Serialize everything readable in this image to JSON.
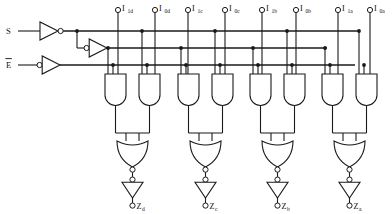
{
  "diagram": {
    "type": "digital-logic-schematic",
    "line_color": "#1a1a1a",
    "background_color": "#ffffff"
  },
  "control_inputs": [
    {
      "id": "select",
      "label": "S",
      "overbar": false,
      "buffer": "non-inverting-buffer",
      "y": 31
    },
    {
      "id": "enable",
      "label": "E",
      "overbar": true,
      "buffer": "inverting-input-buffer",
      "y": 65
    }
  ],
  "internal_nets": [
    {
      "id": "s-true",
      "name": "S buffered",
      "y": 31
    },
    {
      "id": "s-bar",
      "name": "S inverted",
      "y": 48
    },
    {
      "id": "e-net",
      "name": "Enable",
      "y": 65
    }
  ],
  "data_inputs": [
    {
      "id": "i1d",
      "base": "I",
      "sub": "1d",
      "x": 118
    },
    {
      "id": "i0d",
      "base": "I",
      "sub": "0d",
      "x": 155
    },
    {
      "id": "i1c",
      "base": "I",
      "sub": "1c",
      "x": 188
    },
    {
      "id": "i0c",
      "base": "I",
      "sub": "0c",
      "x": 225
    },
    {
      "id": "i1b",
      "base": "I",
      "sub": "1b",
      "x": 262
    },
    {
      "id": "i0b",
      "base": "I",
      "sub": "0b",
      "x": 296
    },
    {
      "id": "i1a",
      "base": "I",
      "sub": "1a",
      "x": 338
    },
    {
      "id": "i0a",
      "base": "I",
      "sub": "0a",
      "x": 370
    }
  ],
  "and_gates": [
    {
      "id": "and-1d",
      "x": 113,
      "inputs": [
        "s-bar",
        "e-net",
        "i1d"
      ]
    },
    {
      "id": "and-0d",
      "x": 147,
      "inputs": [
        "s-true",
        "e-net",
        "i0d"
      ]
    },
    {
      "id": "and-1c",
      "x": 186,
      "inputs": [
        "s-bar",
        "e-net",
        "i1c"
      ]
    },
    {
      "id": "and-0c",
      "x": 220,
      "inputs": [
        "s-true",
        "e-net",
        "i0c"
      ]
    },
    {
      "id": "and-1b",
      "x": 258,
      "inputs": [
        "s-bar",
        "e-net",
        "i1b"
      ]
    },
    {
      "id": "and-0b",
      "x": 292,
      "inputs": [
        "s-true",
        "e-net",
        "i0b"
      ]
    },
    {
      "id": "and-1a",
      "x": 330,
      "inputs": [
        "s-bar",
        "e-net",
        "i1a"
      ]
    },
    {
      "id": "and-0a",
      "x": 364,
      "inputs": [
        "s-true",
        "e-net",
        "i0a"
      ]
    }
  ],
  "nor_gates": [
    {
      "id": "nor-d",
      "x": 130,
      "feeds": "buf-d"
    },
    {
      "id": "nor-c",
      "x": 203,
      "feeds": "buf-c"
    },
    {
      "id": "nor-b",
      "x": 275,
      "feeds": "buf-b"
    },
    {
      "id": "nor-a",
      "x": 347,
      "feeds": "buf-a"
    }
  ],
  "output_buffers": [
    {
      "id": "buf-d",
      "x": 130,
      "type": "inverting-buffer"
    },
    {
      "id": "buf-c",
      "x": 203,
      "type": "inverting-buffer"
    },
    {
      "id": "buf-b",
      "x": 275,
      "type": "inverting-buffer"
    },
    {
      "id": "buf-a",
      "x": 347,
      "type": "inverting-buffer"
    }
  ],
  "outputs": [
    {
      "id": "zd",
      "base": "Z",
      "sub": "d",
      "x": 130
    },
    {
      "id": "zc",
      "base": "Z",
      "sub": "c",
      "x": 203
    },
    {
      "id": "zb",
      "base": "Z",
      "sub": "b",
      "x": 275
    },
    {
      "id": "za",
      "base": "Z",
      "sub": "a",
      "x": 347
    }
  ],
  "icons": {
    "and_gate": "and-gate-icon",
    "or_gate": "or-gate-icon",
    "buffer": "buffer-triangle-icon",
    "bubble": "inversion-bubble-icon",
    "pin": "terminal-pin-icon",
    "junction": "wire-junction-dot-icon"
  }
}
